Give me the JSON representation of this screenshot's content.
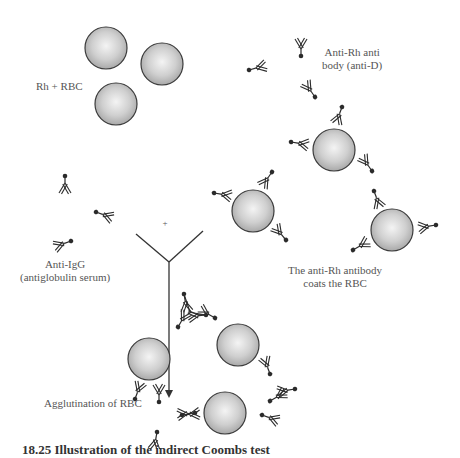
{
  "labels": {
    "rh_rbc": "Rh + RBC",
    "anti_d_line1": "Anti-Rh anti",
    "anti_d_line2": "body (anti-D)",
    "anti_igg_line1": "Anti-IgG",
    "anti_igg_line2": "(antiglobulin serum)",
    "coats_line1": "The anti-Rh antibody",
    "coats_line2": "coats the RBC",
    "agglutination": "Agglutination of RBC",
    "plus": "+"
  },
  "caption": "18.25 Illustration of the indirect Coombs test",
  "colors": {
    "rbc_fill_center": "#f2f2f2",
    "rbc_fill_edge": "#a6a6a6",
    "rbc_stroke": "#3a3a3a",
    "antibody_stroke": "#2b2b2b",
    "text": "#555555"
  }
}
